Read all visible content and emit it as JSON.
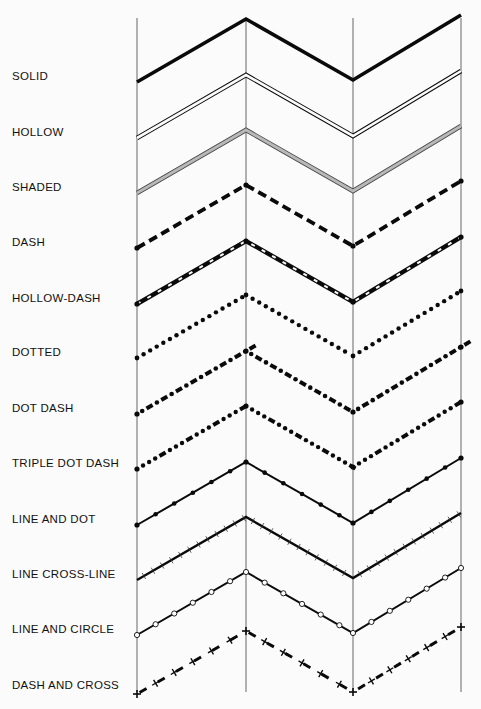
{
  "colors": {
    "ink": "#0a0a0a",
    "background": "#fbfbfb",
    "shade": "#b8b8b8",
    "guide": "#555555"
  },
  "guides_x": [
    137,
    246,
    353,
    461
  ],
  "guide_top": 18,
  "guide_bottom": 692,
  "zigzag": {
    "x": [
      137,
      246,
      353,
      461
    ],
    "dy": [
      0,
      -63,
      -2,
      -67
    ]
  },
  "rows": [
    {
      "id": "solid",
      "label": "SOLID",
      "y0": 82,
      "label_y": 80,
      "style": "solid"
    },
    {
      "id": "hollow",
      "label": "HOLLOW",
      "y0": 138,
      "label_y": 136,
      "style": "hollow"
    },
    {
      "id": "shaded",
      "label": "SHADED",
      "y0": 193,
      "label_y": 191,
      "style": "shaded"
    },
    {
      "id": "dash",
      "label": "DASH",
      "y0": 248,
      "label_y": 246,
      "style": "dash"
    },
    {
      "id": "hollow-dash",
      "label": "HOLLOW-DASH",
      "y0": 304,
      "label_y": 302,
      "style": "hollow-dash"
    },
    {
      "id": "dotted",
      "label": "DOTTED",
      "y0": 358,
      "label_y": 356,
      "style": "dotted"
    },
    {
      "id": "dot-dash",
      "label": "DOT DASH",
      "y0": 414,
      "label_y": 412,
      "style": "dot-dash"
    },
    {
      "id": "triple-dot-dash",
      "label": "TRIPLE DOT DASH",
      "y0": 469,
      "label_y": 467,
      "style": "triple-dot-dash"
    },
    {
      "id": "line-and-dot",
      "label": "LINE AND DOT",
      "y0": 525,
      "label_y": 523,
      "style": "line-and-dot"
    },
    {
      "id": "line-cross-line",
      "label": "LINE CROSS-LINE",
      "y0": 580,
      "label_y": 578,
      "style": "line-cross-line"
    },
    {
      "id": "line-and-circle",
      "label": "LINE AND CIRCLE",
      "y0": 635,
      "label_y": 633,
      "style": "line-and-circle"
    },
    {
      "id": "dash-and-cross",
      "label": "DASH AND CROSS",
      "y0": 694,
      "label_y": 689,
      "style": "dash-and-cross"
    }
  ]
}
